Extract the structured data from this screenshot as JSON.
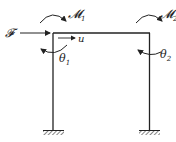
{
  "diagram": {
    "type": "portal-frame",
    "labels": {
      "force": "𝓕",
      "moment1": "𝓜",
      "moment1_sub": "1",
      "moment2": "𝓜",
      "moment2_sub": "2",
      "displacement": "u",
      "theta1": "θ",
      "theta1_sub": "1",
      "theta2": "θ",
      "theta2_sub": "2"
    },
    "supports": [
      "fixed",
      "fixed"
    ],
    "colors": {
      "line": "#222222",
      "background": "#ffffff"
    }
  }
}
